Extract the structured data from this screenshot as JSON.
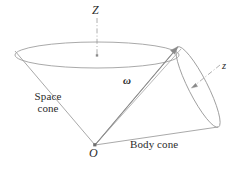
{
  "figure": {
    "background_color": "#ffffff",
    "stroke_color": "#8c8c8c",
    "text_color": "#2b2b2b",
    "width": 244,
    "height": 169
  },
  "labels": {
    "axis_Z": "Z",
    "axis_z": "z",
    "angular_velocity": "ω",
    "origin": "O",
    "space_cone_line1": "Space",
    "space_cone_line2": "cone",
    "body_cone": "Body cone"
  },
  "geometry": {
    "apex": {
      "x": 95,
      "y": 145
    },
    "space_cone_rim_center": {
      "x": 97,
      "y": 55
    },
    "space_cone_rim_rx": 82,
    "space_cone_rim_ry": 13,
    "space_cone_left_contact": {
      "x": 15,
      "y": 51
    },
    "space_cone_right_contact": {
      "x": 178,
      "y": 47
    },
    "body_cone_top": {
      "x": 178,
      "y": 47
    },
    "body_cone_bottom": {
      "x": 218,
      "y": 127
    },
    "omega_tip": {
      "x": 178,
      "y": 47
    },
    "Z_axis_top": {
      "x": 97,
      "y": 18
    },
    "Z_axis_bottom": {
      "x": 97,
      "y": 56
    },
    "z_axis_arrow_from": {
      "x": 220,
      "y": 66
    },
    "z_axis_arrow_to": {
      "x": 192,
      "y": 87
    }
  }
}
